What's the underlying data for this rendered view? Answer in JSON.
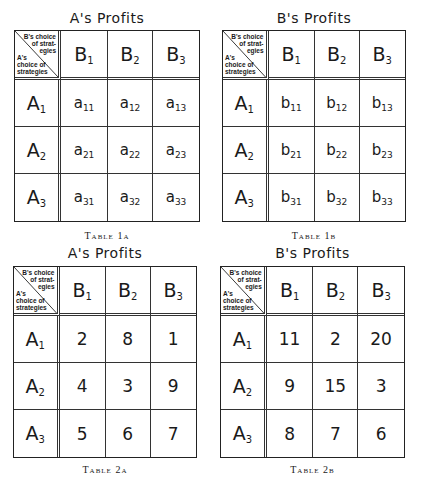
{
  "tables": [
    {
      "id": "1a",
      "title": "A's Profits",
      "caption": "Table 1a",
      "corner": {
        "col_label": [
          "B's choice",
          "of strat-",
          "egies"
        ],
        "row_label": [
          "A's",
          "choice of",
          "strategies"
        ]
      },
      "col_headers": [
        {
          "base": "B",
          "sub": "1"
        },
        {
          "base": "B",
          "sub": "2"
        },
        {
          "base": "B",
          "sub": "3"
        }
      ],
      "row_headers": [
        {
          "base": "A",
          "sub": "1"
        },
        {
          "base": "A",
          "sub": "2"
        },
        {
          "base": "A",
          "sub": "3"
        }
      ],
      "cells": [
        [
          {
            "base": "a",
            "sub": "11"
          },
          {
            "base": "a",
            "sub": "12"
          },
          {
            "base": "a",
            "sub": "13"
          }
        ],
        [
          {
            "base": "a",
            "sub": "21"
          },
          {
            "base": "a",
            "sub": "22"
          },
          {
            "base": "a",
            "sub": "23"
          }
        ],
        [
          {
            "base": "a",
            "sub": "31"
          },
          {
            "base": "a",
            "sub": "32"
          },
          {
            "base": "a",
            "sub": "33"
          }
        ]
      ]
    },
    {
      "id": "1b",
      "title": "B's Profits",
      "caption": "Table 1b",
      "corner": {
        "col_label": [
          "B's choice",
          "of strat-",
          "egies"
        ],
        "row_label": [
          "A's",
          "choice of",
          "strategies"
        ]
      },
      "col_headers": [
        {
          "base": "B",
          "sub": "1"
        },
        {
          "base": "B",
          "sub": "2"
        },
        {
          "base": "B",
          "sub": "3"
        }
      ],
      "row_headers": [
        {
          "base": "A",
          "sub": "1"
        },
        {
          "base": "A",
          "sub": "2"
        },
        {
          "base": "A",
          "sub": "3"
        }
      ],
      "cells": [
        [
          {
            "base": "b",
            "sub": "11"
          },
          {
            "base": "b",
            "sub": "12"
          },
          {
            "base": "b",
            "sub": "13"
          }
        ],
        [
          {
            "base": "b",
            "sub": "21"
          },
          {
            "base": "b",
            "sub": "22"
          },
          {
            "base": "b",
            "sub": "23"
          }
        ],
        [
          {
            "base": "b",
            "sub": "31"
          },
          {
            "base": "b",
            "sub": "32"
          },
          {
            "base": "b",
            "sub": "33"
          }
        ]
      ]
    },
    {
      "id": "2a",
      "title": "A's Profits",
      "caption": "Table 2a",
      "corner": {
        "col_label": [
          "B's choice",
          "of strat-",
          "egies"
        ],
        "row_label": [
          "A's",
          "choice of",
          "strategies"
        ]
      },
      "col_headers": [
        {
          "base": "B",
          "sub": "1"
        },
        {
          "base": "B",
          "sub": "2"
        },
        {
          "base": "B",
          "sub": "3"
        }
      ],
      "row_headers": [
        {
          "base": "A",
          "sub": "1"
        },
        {
          "base": "A",
          "sub": "2"
        },
        {
          "base": "A",
          "sub": "3"
        }
      ],
      "values": [
        [
          "2",
          "8",
          "1"
        ],
        [
          "4",
          "3",
          "9"
        ],
        [
          "5",
          "6",
          "7"
        ]
      ]
    },
    {
      "id": "2b",
      "title": "B's Profits",
      "caption": "Table 2b",
      "corner": {
        "col_label": [
          "B's choice",
          "of strat-",
          "egies"
        ],
        "row_label": [
          "A's",
          "choice of",
          "strategies"
        ]
      },
      "col_headers": [
        {
          "base": "B",
          "sub": "1"
        },
        {
          "base": "B",
          "sub": "2"
        },
        {
          "base": "B",
          "sub": "3"
        }
      ],
      "row_headers": [
        {
          "base": "A",
          "sub": "1"
        },
        {
          "base": "A",
          "sub": "2"
        },
        {
          "base": "A",
          "sub": "3"
        }
      ],
      "values": [
        [
          "11",
          "2",
          "20"
        ],
        [
          "9",
          "15",
          "3"
        ],
        [
          "8",
          "7",
          "6"
        ]
      ]
    }
  ]
}
